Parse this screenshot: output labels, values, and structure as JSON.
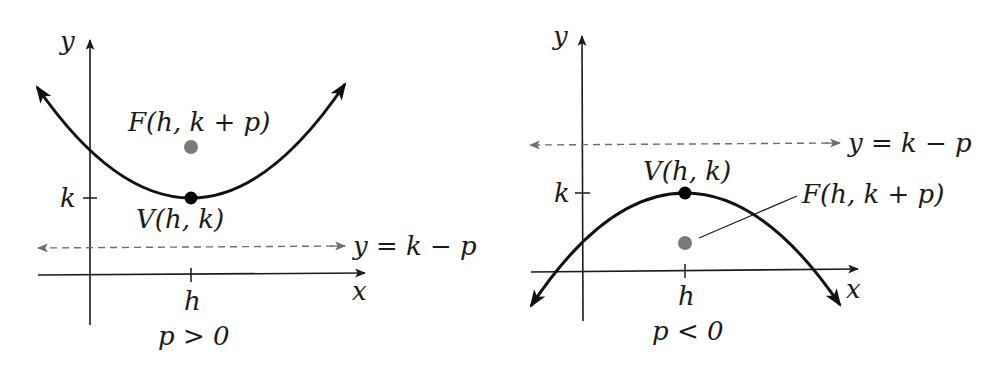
{
  "diagrams": [
    {
      "id": "left",
      "caption": "p > 0",
      "axis_labels": {
        "x": "x",
        "y": "y"
      },
      "tick_labels": {
        "h": "h",
        "k": "k"
      },
      "vertex_label": "V(h, k)",
      "focus_label": "F(h, k + p)",
      "directrix_label": "y = k − p",
      "orientation": "opens-up"
    },
    {
      "id": "right",
      "caption": "p < 0",
      "axis_labels": {
        "x": "x",
        "y": "y"
      },
      "tick_labels": {
        "h": "h",
        "k": "k"
      },
      "vertex_label": "V(h, k)",
      "focus_label": "F(h, k + p)",
      "directrix_label": "y = k − p",
      "orientation": "opens-down"
    }
  ],
  "colors": {
    "curve": "#111111",
    "axis": "#1a1a1a",
    "focus": "#7a7a7a",
    "directrix": "#6e6e6e",
    "vertex": "#000000"
  }
}
